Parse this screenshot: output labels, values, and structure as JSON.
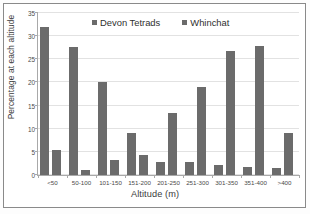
{
  "chart_data": {
    "type": "bar",
    "title": "",
    "xlabel": "Altitude (m)",
    "ylabel": "Percentage at each altitude",
    "categories": [
      "<50",
      "50-100",
      "101-150",
      "151-200",
      "201-250",
      "251-300",
      "301-350",
      "351-400",
      ">400"
    ],
    "series": [
      {
        "name": "Devon Tetrads",
        "color": "#6b6b6b",
        "values": [
          32.0,
          27.7,
          20.0,
          9.0,
          2.8,
          2.8,
          2.2,
          1.8,
          1.5
        ]
      },
      {
        "name": "Whinchat",
        "color": "#6b6b6b",
        "values": [
          5.5,
          1.1,
          3.2,
          4.4,
          13.3,
          19.0,
          26.7,
          27.8,
          9.0
        ]
      }
    ],
    "ylim": [
      0,
      35
    ],
    "yticks": [
      0,
      5,
      10,
      15,
      20,
      25,
      30,
      35
    ],
    "ytick_labels": [
      "0",
      "5",
      "10",
      "15",
      "20",
      "25",
      "30",
      "35"
    ],
    "grid": true,
    "legend_position": "top-center"
  },
  "legend": {
    "items": [
      {
        "label": "Devon Tetrads",
        "swatch": "legend-swatch-icon"
      },
      {
        "label": "Whinchat",
        "swatch": "legend-swatch-icon"
      }
    ]
  }
}
